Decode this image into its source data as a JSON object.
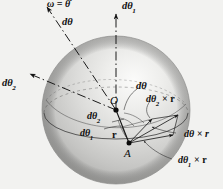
{
  "figure": {
    "background_color": "#f2f2f0",
    "sphere": {
      "center_x": 116,
      "center_y": 110,
      "radius": 74,
      "light_color": "#f0f0ee",
      "mid_color": "#c9c9c7",
      "dark_color": "#9a9a98"
    },
    "points": {
      "O": "O",
      "A": "A"
    },
    "labels": {
      "omega": "ω = θ̇",
      "d_theta_top": "dθ",
      "d_theta_1_top": "dθ",
      "d_theta_1_top_sub": "1",
      "d_theta_2_left": "dθ",
      "d_theta_2_left_sub": "2",
      "d_theta_center": "dθ",
      "d_theta_2_center": "dθ",
      "d_theta_2_center_sub": "2",
      "d_theta_1_center": "dθ",
      "d_theta_1_center_sub": "1",
      "r_vector": "r",
      "d_theta_2_cross_r": "dθ",
      "d_theta_2_cross_r_sub": "2",
      "d_theta_2_cross_r_tail": " × r",
      "d_theta_cross_r": "dθ × r",
      "d_theta_1_cross_r": "dθ",
      "d_theta_1_cross_r_sub": "1",
      "d_theta_1_cross_r_tail": " × r"
    },
    "vectors": [
      {
        "name": "d-theta-axis",
        "from": "O",
        "to": "upper-left",
        "style": "dash-dot-arrow"
      },
      {
        "name": "d-theta-1-axis",
        "from": "O",
        "to": "up",
        "style": "dash-dot-arrow"
      },
      {
        "name": "d-theta-2-axis",
        "from": "O",
        "to": "left",
        "style": "dash-dot-arrow"
      },
      {
        "name": "r-vector",
        "from": "O",
        "to": "A",
        "style": "solid-arrow"
      },
      {
        "name": "d-theta-cross-r",
        "from": "A",
        "to": "upper-right",
        "style": "solid-arrow"
      },
      {
        "name": "d-theta-1-cross-r",
        "from": "A",
        "to": "right",
        "style": "solid-arrow"
      },
      {
        "name": "d-theta-2-cross-r",
        "from": "A",
        "to": "up-right",
        "style": "solid-arrow"
      }
    ]
  }
}
